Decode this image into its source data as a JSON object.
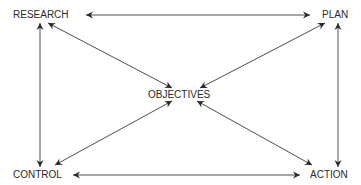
{
  "diagram": {
    "nodes": {
      "research": {
        "label": "RESEARCH"
      },
      "plan": {
        "label": "PLAN"
      },
      "objectives": {
        "label": "OBJECTIVES"
      },
      "control": {
        "label": "CONTROL"
      },
      "action": {
        "label": "ACTION"
      }
    },
    "edges": [
      {
        "from": "research",
        "to": "plan",
        "direction": "both"
      },
      {
        "from": "research",
        "to": "control",
        "direction": "both"
      },
      {
        "from": "plan",
        "to": "action",
        "direction": "both"
      },
      {
        "from": "control",
        "to": "action",
        "direction": "both"
      },
      {
        "from": "research",
        "to": "objectives",
        "direction": "both"
      },
      {
        "from": "plan",
        "to": "objectives",
        "direction": "both"
      },
      {
        "from": "control",
        "to": "objectives",
        "direction": "both"
      },
      {
        "from": "action",
        "to": "objectives",
        "direction": "both"
      }
    ],
    "colors": {
      "line": "#3a3a3a",
      "text": "#2a2a2a",
      "background": "#ffffff"
    }
  }
}
